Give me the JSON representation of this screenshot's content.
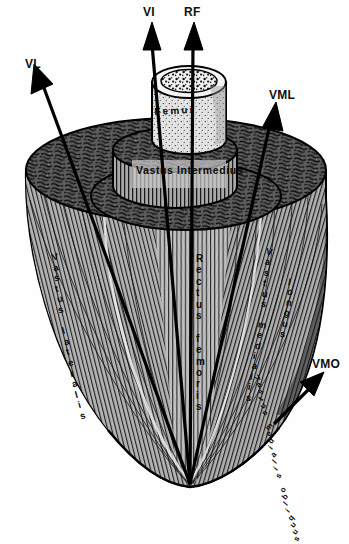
{
  "figure": {
    "type": "anatomical-illustration",
    "style": "black-and-white engraving",
    "background_color": "#ffffff",
    "ink_color": "#000000"
  },
  "pointer_labels": [
    {
      "id": "vi",
      "text": "VI",
      "meaning": "Vastus intermedius",
      "arrow_direction": "up"
    },
    {
      "id": "rf",
      "text": "RF",
      "meaning": "Rectus femoris",
      "arrow_direction": "up"
    },
    {
      "id": "vl",
      "text": "VL",
      "meaning": "Vastus lateralis",
      "arrow_direction": "up-left"
    },
    {
      "id": "vml",
      "text": "VML",
      "meaning": "Vastus medialis longus",
      "arrow_direction": "up-right"
    },
    {
      "id": "vmo",
      "text": "VMO",
      "meaning": "Vastus medialis obliquus",
      "arrow_direction": "up-right"
    }
  ],
  "inline_labels": {
    "femur": "Femur",
    "vastus_intermedius_line1": "Vastus",
    "vastus_intermedius_line2": "Intermedius",
    "rectus_femoris": "Rectus femoris",
    "vastus_lateralis": "Vastus lateralis",
    "vastus_medialis": "Vastus medialis",
    "longus": "longus",
    "vastus_medialis_obliquus": "Vastus medialis obliquus"
  },
  "structures": [
    {
      "name": "femur",
      "description": "central bone cylinder with stippled marrow cross-section"
    },
    {
      "name": "vastus-intermedius-cylinder",
      "description": "inner muscle cylinder surrounding femur"
    },
    {
      "name": "rectus-femoris-layer",
      "description": "middle muscle tier cut surface"
    },
    {
      "name": "outer-muscle-mass",
      "description": "outer muscle mass tapering to distal tendon"
    },
    {
      "name": "common-tendon-apex",
      "description": "convergence point of muscle fibers at bottom"
    }
  ]
}
